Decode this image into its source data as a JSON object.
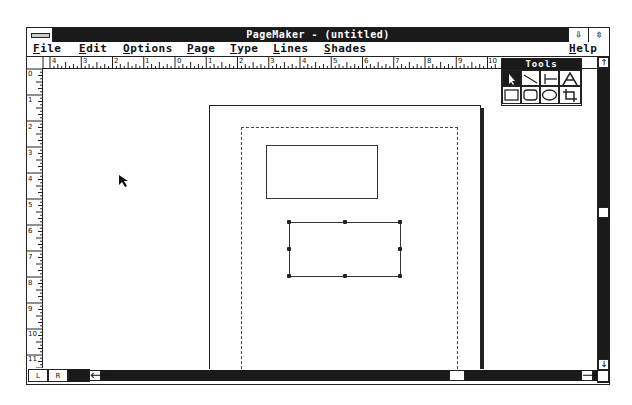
{
  "window": {
    "title": "PageMaker - (untitled)",
    "minimize_label": "⇩",
    "maximize_label": "⇳"
  },
  "menubar": {
    "items": [
      {
        "label": "File",
        "mnemonic": "F",
        "rest": "ile"
      },
      {
        "label": "Edit",
        "mnemonic": "E",
        "rest": "dit"
      },
      {
        "label": "Options",
        "mnemonic": "O",
        "rest": "ptions"
      },
      {
        "label": "Page",
        "mnemonic": "P",
        "rest": "age"
      },
      {
        "label": "Type",
        "mnemonic": "T",
        "rest": "ype"
      },
      {
        "label": "Lines",
        "mnemonic": "L",
        "rest": "ines"
      },
      {
        "label": "Shades",
        "mnemonic": "S",
        "rest": "hades"
      },
      {
        "label": "Help",
        "mnemonic": "H",
        "rest": "elp"
      }
    ]
  },
  "rulers": {
    "horizontal_labels": [
      "4",
      "3",
      "2",
      "1",
      "0",
      "1",
      "2",
      "3",
      "4",
      "5",
      "6",
      "7",
      "8",
      "9",
      "10"
    ],
    "vertical_labels": [
      "0",
      "1",
      "2",
      "3",
      "4",
      "5",
      "6",
      "7",
      "8",
      "9",
      "10",
      "11"
    ]
  },
  "tools_palette": {
    "title": "Tools",
    "tools": [
      {
        "name": "pointer",
        "glyph": "↖",
        "selected": true
      },
      {
        "name": "diagonal-line",
        "glyph": "╲",
        "selected": false
      },
      {
        "name": "perpendicular-line",
        "glyph": "├",
        "selected": false
      },
      {
        "name": "text",
        "glyph": "A",
        "selected": false
      },
      {
        "name": "square-corner-rectangle",
        "glyph": "□",
        "selected": false
      },
      {
        "name": "rounded-rectangle",
        "glyph": "▢",
        "selected": false
      },
      {
        "name": "oval",
        "glyph": "○",
        "selected": false
      },
      {
        "name": "cropping",
        "glyph": "⌗",
        "selected": false
      }
    ]
  },
  "page_icons": {
    "left": "L",
    "right": "R"
  },
  "scrollbars": {
    "up": "🡑",
    "down": "🡓",
    "left": "🡐",
    "right": "🡒"
  }
}
